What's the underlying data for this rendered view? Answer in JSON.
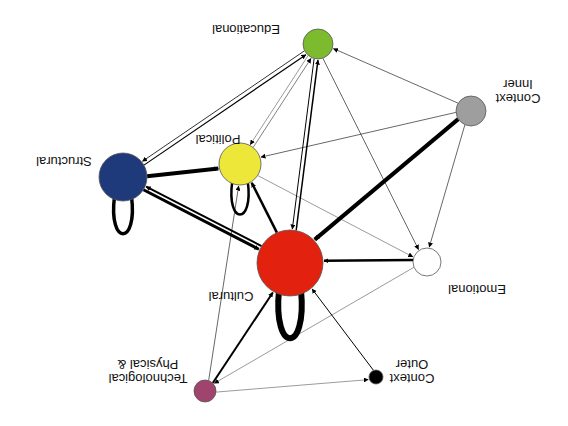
{
  "diagram": {
    "orientation": "rotated-180",
    "nodes": [
      {
        "id": "educational",
        "label": "Educational",
        "color": "#7dbb2e",
        "x": 318,
        "y": 44,
        "r": 15,
        "label_lines": [
          "Educational"
        ],
        "lx": 246,
        "ly": 30
      },
      {
        "id": "inner_context",
        "label": "Inner Context",
        "color": "#9e9e9e",
        "x": 471,
        "y": 111,
        "r": 15,
        "label_lines": [
          "Context",
          "Inner"
        ],
        "lx": 518,
        "ly": 92
      },
      {
        "id": "structural",
        "label": "Structural",
        "color": "#1f3a7a",
        "x": 123,
        "y": 177,
        "r": 24,
        "label_lines": [
          "Structural"
        ],
        "lx": 64,
        "ly": 162
      },
      {
        "id": "political",
        "label": "Political",
        "color": "#ece739",
        "x": 240,
        "y": 164,
        "r": 21,
        "label_lines": [
          "Political"
        ],
        "lx": 218,
        "ly": 140
      },
      {
        "id": "cultural",
        "label": "Cultural",
        "color": "#e2220f",
        "x": 290,
        "y": 263,
        "r": 33,
        "label_lines": [
          "Cultural"
        ],
        "lx": 231,
        "ly": 297
      },
      {
        "id": "emotional",
        "label": "Emotional",
        "color": "#ffffff",
        "x": 427,
        "y": 262,
        "r": 14,
        "label_lines": [
          "Emotional"
        ],
        "lx": 477,
        "ly": 290
      },
      {
        "id": "physical_tech",
        "label": "Physical & Technological",
        "color": "#a0446d",
        "x": 205,
        "y": 391,
        "r": 11,
        "label_lines": [
          "Technological",
          "Physical &"
        ],
        "lx": 148,
        "ly": 372
      },
      {
        "id": "outer_context",
        "label": "Outer Context",
        "color": "#000000",
        "x": 376,
        "y": 377,
        "r": 7,
        "label_lines": [
          "Context",
          "Outer"
        ],
        "lx": 412,
        "ly": 372
      }
    ],
    "edges": [
      {
        "from": "structural",
        "to": "educational",
        "w": 1.2
      },
      {
        "from": "educational",
        "to": "structural",
        "w": 0.8
      },
      {
        "from": "structural",
        "to": "political",
        "w": 4
      },
      {
        "from": "structural",
        "to": "cultural",
        "w": 3
      },
      {
        "from": "cultural",
        "to": "structural",
        "w": 2
      },
      {
        "from": "political",
        "to": "educational",
        "w": 0.5
      },
      {
        "from": "educational",
        "to": "political",
        "w": 0.4
      },
      {
        "from": "cultural",
        "to": "political",
        "w": 2.5
      },
      {
        "from": "cultural",
        "to": "educational",
        "w": 1.5
      },
      {
        "from": "educational",
        "to": "cultural",
        "w": 1
      },
      {
        "from": "inner_context",
        "to": "educational",
        "w": 0.6
      },
      {
        "from": "inner_context",
        "to": "political",
        "w": 0.6
      },
      {
        "from": "inner_context",
        "to": "cultural",
        "w": 4
      },
      {
        "from": "inner_context",
        "to": "emotional",
        "w": 0.6
      },
      {
        "from": "educational",
        "to": "emotional",
        "w": 0.6
      },
      {
        "from": "political",
        "to": "emotional",
        "w": 0.4
      },
      {
        "from": "emotional",
        "to": "cultural",
        "w": 2.5
      },
      {
        "from": "emotional",
        "to": "physical_tech",
        "w": 0.4
      },
      {
        "from": "physical_tech",
        "to": "cultural",
        "w": 2
      },
      {
        "from": "physical_tech",
        "to": "political",
        "w": 0.6
      },
      {
        "from": "physical_tech",
        "to": "outer_context",
        "w": 0.4
      },
      {
        "from": "outer_context",
        "to": "cultural",
        "w": 1
      }
    ],
    "loops": [
      {
        "node": "structural",
        "w": 3.5
      },
      {
        "node": "political",
        "w": 2.5
      },
      {
        "node": "cultural",
        "w": 6
      }
    ]
  }
}
